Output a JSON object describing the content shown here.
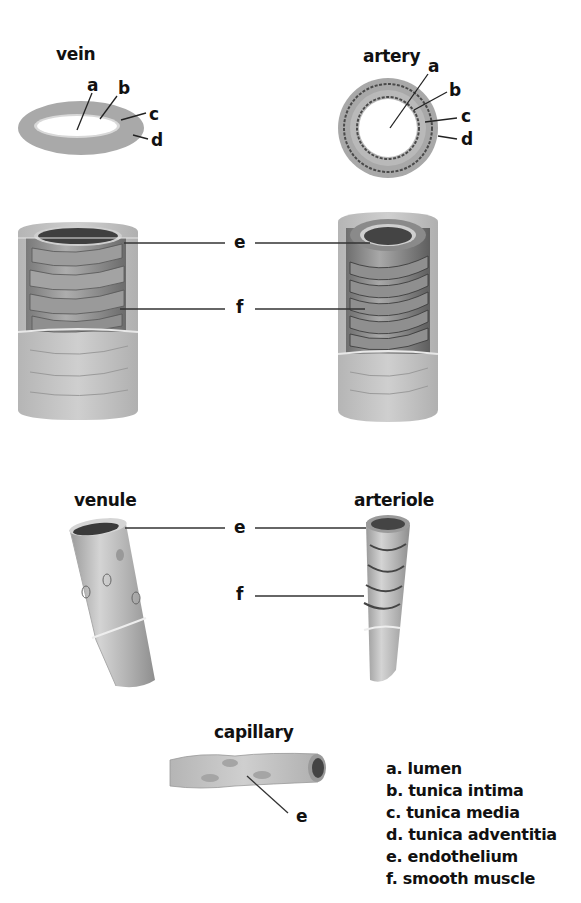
{
  "diagram": {
    "titles": {
      "vein": "vein",
      "artery": "artery",
      "venule": "venule",
      "arteriole": "arteriole",
      "capillary": "capillary"
    },
    "callout_letters": {
      "a": "a",
      "b": "b",
      "c": "c",
      "d": "d",
      "e": "e",
      "f": "f"
    },
    "legend": [
      "a. lumen",
      "b. tunica intima",
      "c. tunica media",
      "d. tunica adventitia",
      "e. endothelium",
      "f. smooth muscle"
    ],
    "colors": {
      "outer_layer": "#b8b8b8",
      "muscle_layer": "#8a8a8a",
      "lumen": "#ffffff",
      "dark_interior": "#555555",
      "line": "#333333"
    }
  }
}
